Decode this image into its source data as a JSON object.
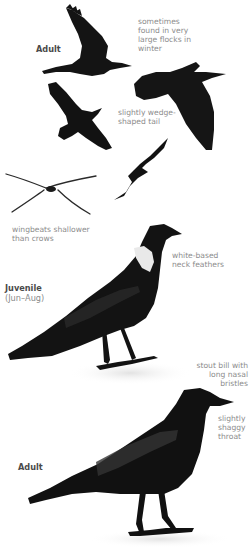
{
  "colors": {
    "plumage": "#141414",
    "plumage_sheen": "#3a3a3a",
    "neck_patch": "#e8e8e8",
    "ground_shadow": "#e6e6e6",
    "annotation_text": "#8c8c8c",
    "label_text": "#4a4a4a"
  },
  "plates": [
    {
      "id": "flight",
      "label": "Adult",
      "annotations": [
        {
          "text": "sometimes\nfound in very\nlarge flocks in\nwinter"
        },
        {
          "text": "slightly wedge-\nshaped tail"
        },
        {
          "text": "wingbeats shallower\nthan crows"
        }
      ]
    },
    {
      "id": "juvenile",
      "label": "Juvenile",
      "sublabel": "(Jun–Aug)",
      "annotations": [
        {
          "text": "white-based\nneck feathers"
        }
      ]
    },
    {
      "id": "adult-standing",
      "label": "Adult",
      "annotations": [
        {
          "text": "stout bill with\nlong nasal\nbristles"
        },
        {
          "text": "slightly\nshaggy\nthroat"
        }
      ]
    }
  ],
  "illustrations": [
    {
      "name": "adult-flight-upper-wing",
      "view": "flying, wings raised"
    },
    {
      "name": "adult-flight-glide",
      "view": "gliding, tail spread"
    },
    {
      "name": "adult-flight-from-below",
      "view": "from below, wings spread"
    },
    {
      "name": "adult-flight-distant",
      "view": "distant flight silhouette"
    },
    {
      "name": "head-on-flight",
      "view": "head-on silhouette"
    },
    {
      "name": "juvenile-standing",
      "view": "standing, side view"
    },
    {
      "name": "adult-standing",
      "view": "standing, side view"
    }
  ]
}
